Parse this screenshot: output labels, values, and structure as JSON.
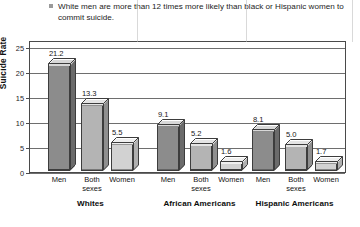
{
  "caption": {
    "bullet": "bullet-marker",
    "text": "White men are more than 12 times more likely than black or Hispanic women to commit suicide."
  },
  "chart_data": {
    "type": "bar",
    "title": "White men are more than 12 times more likely than black or Hispanic women to commit suicide.",
    "xlabel": "",
    "ylabel": "Suicide Rate",
    "ylim": [
      0,
      25
    ],
    "yticks": [
      0,
      5,
      10,
      15,
      20,
      25
    ],
    "ytick_labels": [
      "0",
      "5",
      "10",
      "15",
      "20",
      "25"
    ],
    "grid": true,
    "legend": "none",
    "groups": [
      "Whites",
      "African Americans",
      "Hispanic Americans"
    ],
    "categories": [
      "Men",
      "Both sexes",
      "Women"
    ],
    "series": [
      {
        "name": "Men",
        "values": [
          21.2,
          9.1,
          8.1
        ]
      },
      {
        "name": "Both sexes",
        "values": [
          13.3,
          5.2,
          5.0
        ]
      },
      {
        "name": "Women",
        "values": [
          5.5,
          1.6,
          1.7
        ]
      }
    ],
    "bars": [
      {
        "group": "Whites",
        "category": "Men",
        "value": 21.2,
        "label": "21.2"
      },
      {
        "group": "Whites",
        "category": "Both sexes",
        "value": 13.3,
        "label": "13.3"
      },
      {
        "group": "Whites",
        "category": "Women",
        "value": 5.5,
        "label": "5.5"
      },
      {
        "group": "African Americans",
        "category": "Men",
        "value": 9.1,
        "label": "9.1"
      },
      {
        "group": "African Americans",
        "category": "Both sexes",
        "value": 5.2,
        "label": "5.2"
      },
      {
        "group": "African Americans",
        "category": "Women",
        "value": 1.6,
        "label": "1.6"
      },
      {
        "group": "Hispanic Americans",
        "category": "Men",
        "value": 8.1,
        "label": "8.1"
      },
      {
        "group": "Hispanic Americans",
        "category": "Both sexes",
        "value": 5.0,
        "label": "5.0"
      },
      {
        "group": "Hispanic Americans",
        "category": "Women",
        "value": 1.7,
        "label": "1.7"
      }
    ],
    "colors": {
      "men_front": "#8c8c8c",
      "men_top": "#d8d8d8",
      "men_side": "#6b6b6b",
      "both_front": "#b4b4b4",
      "both_top": "#e4e4e4",
      "both_side": "#8f8f8f",
      "women_front": "#d2d2d2",
      "women_top": "#efefef",
      "women_side": "#b0b0b0",
      "axis": "#4a4a4a",
      "grid": "#6e6e6e",
      "text": "#1a1a1a",
      "background": "#ffffff"
    }
  },
  "axis": {
    "y_title": "Suicide Rate",
    "tick_labels": [
      "25",
      "20",
      "15",
      "10",
      "5",
      "0"
    ]
  },
  "category_labels": [
    "Men",
    "Both sexes",
    "Women",
    "Men",
    "Both sexes",
    "Women",
    "Men",
    "Both sexes",
    "Women"
  ],
  "group_labels": [
    "Whites",
    "African Americans",
    "Hispanic Americans"
  ]
}
